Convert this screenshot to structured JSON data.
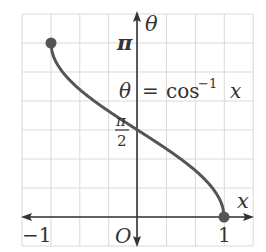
{
  "chart_data": {
    "type": "line",
    "title": "",
    "equation_label": {
      "lhs": "θ",
      "eq": "=",
      "func": "cos",
      "sup": "−1",
      "arg": "x"
    },
    "xlabel": "x",
    "ylabel": "θ",
    "xlim": [
      -1.0,
      1.0
    ],
    "ylim": [
      0,
      3.14159
    ],
    "grid": true,
    "x_ticks": [
      {
        "value": -1,
        "label": "−1"
      },
      {
        "value": 0,
        "label": "O"
      },
      {
        "value": 1,
        "label": "1"
      }
    ],
    "y_ticks": [
      {
        "value": 1.5708,
        "label": "π/2",
        "num": "π",
        "den": "2"
      },
      {
        "value": 3.14159,
        "label": "π"
      }
    ],
    "series": [
      {
        "name": "θ = cos⁻¹ x",
        "x": [
          -1,
          -0.9,
          -0.75,
          -0.5,
          -0.25,
          0,
          0.25,
          0.5,
          0.75,
          0.9,
          1
        ],
        "y": [
          3.1416,
          2.6906,
          2.4189,
          2.0944,
          1.8235,
          1.5708,
          1.3181,
          1.0472,
          0.7227,
          0.451,
          0
        ]
      }
    ],
    "endpoints": [
      {
        "x": -1,
        "y": 3.14159,
        "style": "filled-dot"
      },
      {
        "x": 1,
        "y": 0,
        "style": "filled-dot"
      }
    ],
    "colors": {
      "curve": "#555555",
      "axis": "#333333",
      "grid": "#d9d9d9",
      "text": "#333333"
    }
  }
}
